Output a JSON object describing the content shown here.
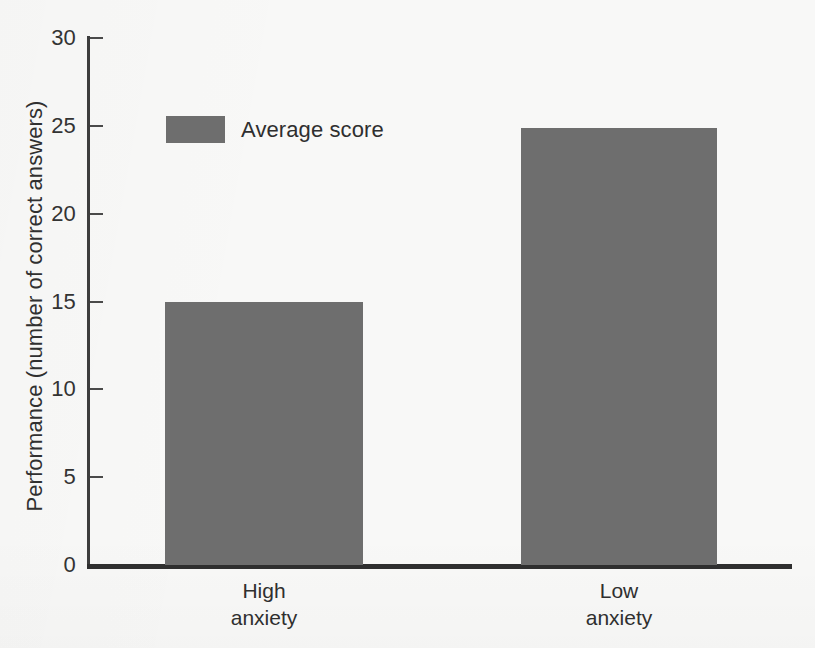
{
  "chart_data": {
    "type": "bar",
    "title": "",
    "xlabel": "",
    "ylabel": "Performance (number of correct answers)",
    "categories": [
      "High\nanxiety",
      "Low\nanxiety"
    ],
    "category_lines": [
      [
        "High",
        "anxiety"
      ],
      [
        "Low",
        "anxiety"
      ]
    ],
    "values": [
      15.0,
      24.9
    ],
    "series": [
      {
        "name": "Average score",
        "values": [
          15.0,
          24.9
        ],
        "color": "#6e6e6e"
      }
    ],
    "ylim": [
      0,
      30
    ],
    "ytick_labels": [
      "0",
      "5",
      "10",
      "15",
      "20",
      "25",
      "30"
    ],
    "ytick_values": [
      0,
      5,
      10,
      15,
      20,
      25,
      30
    ],
    "grid": false,
    "legend": {
      "position": "top-left-inside",
      "entries": [
        {
          "label": "Average score",
          "color": "#6e6e6e"
        }
      ]
    },
    "annotations": []
  },
  "style": {
    "background": "#f8f8f7",
    "bar_color": "#6e6e6e",
    "axis_color": "#3d3d3d",
    "text_color": "#2f2f2f"
  }
}
